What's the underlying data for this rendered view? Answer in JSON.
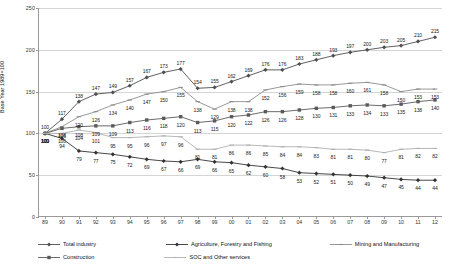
{
  "chart_data": {
    "type": "line",
    "title": "",
    "xlabel": "",
    "ylabel": "Base Year 1989=100",
    "ylim": [
      0,
      250
    ],
    "yticks": [
      0,
      50,
      100,
      150,
      200,
      250
    ],
    "grid": true,
    "legend_position": "bottom",
    "categories": [
      "89",
      "90",
      "91",
      "92",
      "93",
      "94",
      "95",
      "96",
      "97",
      "98",
      "99",
      "00",
      "01",
      "02",
      "03",
      "04",
      "05",
      "06",
      "07",
      "08",
      "09",
      "10",
      "11",
      "12"
    ],
    "series": [
      {
        "name": "Total industry",
        "color": "#4f4f4f",
        "marker": "diamond",
        "values": [
          100,
          117,
          138,
          147,
          149,
          157,
          167,
          173,
          177,
          154,
          155,
          162,
          169,
          176,
          176,
          183,
          188,
          193,
          197,
          200,
          203,
          205,
          210,
          215
        ]
      },
      {
        "name": "Agriculture, Forestry and Fishing",
        "color": "#333333",
        "marker": "diamond",
        "values": [
          100,
          94,
          79,
          77,
          75,
          72,
          69,
          67,
          66,
          69,
          66,
          65,
          62,
          60,
          58,
          53,
          52,
          51,
          50,
          49,
          47,
          45,
          44,
          44
        ]
      },
      {
        "name": "Mining and Manufacturing",
        "color": "#8d8d8d",
        "marker": "dash",
        "values": [
          100,
          108,
          120,
          126,
          134,
          140,
          147,
          150,
          155,
          138,
          129,
          138,
          138,
          152,
          156,
          159,
          158,
          158,
          160,
          161,
          158,
          150,
          153,
          153
        ]
      },
      {
        "name": "Construction",
        "color": "#5a5a5a",
        "marker": "square",
        "values": [
          100,
          106,
          108,
          109,
          109,
          113,
          116,
          118,
          120,
          113,
          115,
          120,
          122,
          126,
          126,
          128,
          130,
          131,
          133,
          134,
          133,
          135,
          138,
          140
        ]
      },
      {
        "name": "SOC and Other services",
        "color": "#b0b0b0",
        "marker": "dash",
        "values": [
          100,
          100,
          104,
          101,
          95,
          95,
          96,
          97,
          96,
          81,
          81,
          86,
          86,
          85,
          84,
          84,
          83,
          81,
          81,
          80,
          77,
          81,
          82,
          82
        ]
      }
    ],
    "endpoint_extra": {
      "total_industry_last": "215",
      "mining_last": "155",
      "construction_last": "140"
    }
  }
}
